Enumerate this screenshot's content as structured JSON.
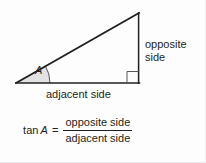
{
  "figure": {
    "background_color": "#fdfdfd",
    "line_color": "#231f20",
    "angle_fill_color": "#e2e2e4"
  },
  "triangle": {
    "vertices": {
      "angle_vertex": [
        16,
        83
      ],
      "apex": [
        139,
        13
      ],
      "right_angle": [
        139,
        83
      ]
    },
    "angle_label": "A",
    "right_angle_marker": "square"
  },
  "labels": {
    "opposite_side_line1": "opposite",
    "opposite_side_line2": "side",
    "adjacent_side": "adjacent side"
  },
  "formula": {
    "function": "tan",
    "variable": "A",
    "equals": "=",
    "numerator": "opposite side",
    "denominator": "adjacent side"
  }
}
